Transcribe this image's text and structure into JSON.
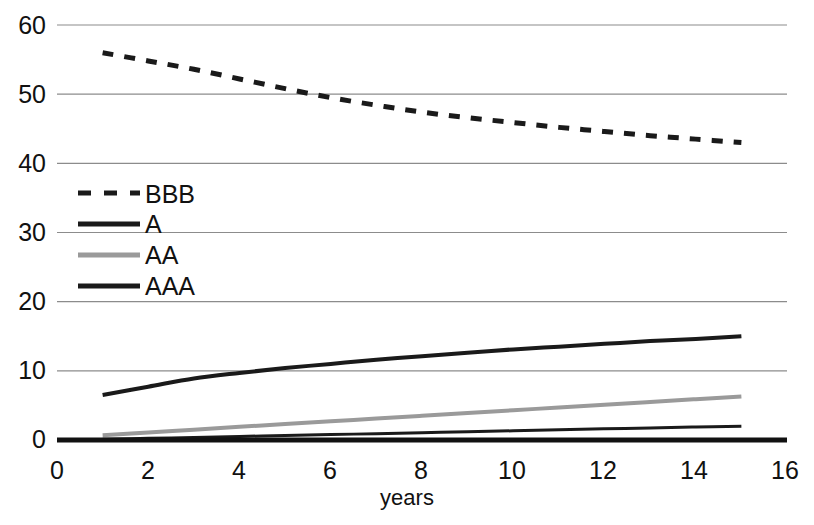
{
  "chart_data": {
    "type": "line",
    "title": "",
    "subtitle": "",
    "xlabel": "years",
    "ylabel": "",
    "xlim": [
      0,
      16
    ],
    "ylim": [
      0,
      60
    ],
    "grid": true,
    "grid_axis": "y",
    "legend_position": "upper-left-inside",
    "x_ticks": [
      0,
      2,
      4,
      6,
      8,
      10,
      12,
      14,
      16
    ],
    "x_tick_labels": [
      "0",
      "2",
      "4",
      "6",
      "8",
      "10",
      "12",
      "14",
      "16"
    ],
    "y_ticks": [
      0,
      10,
      20,
      30,
      40,
      50,
      60
    ],
    "y_tick_labels": [
      "0",
      "10",
      "20",
      "30",
      "40",
      "50",
      "60"
    ],
    "x": [
      1,
      2,
      3,
      4,
      5,
      6,
      7,
      8,
      9,
      10,
      11,
      12,
      13,
      14,
      15
    ],
    "series": [
      {
        "name": "BBB",
        "style": "dashed",
        "color": "#1a1a1a",
        "width": 5,
        "values": [
          56.0,
          54.8,
          53.6,
          52.2,
          50.8,
          49.5,
          48.4,
          47.4,
          46.6,
          45.9,
          45.2,
          44.6,
          44.0,
          43.5,
          43.0
        ]
      },
      {
        "name": "A",
        "style": "solid",
        "color": "#1a1a1a",
        "width": 4,
        "values": [
          6.5,
          7.7,
          8.9,
          9.7,
          10.4,
          11.0,
          11.6,
          12.1,
          12.6,
          13.1,
          13.5,
          13.9,
          14.3,
          14.6,
          15.0
        ]
      },
      {
        "name": "AA",
        "style": "solid",
        "color": "#9a9a9a",
        "width": 4,
        "values": [
          0.7,
          1.1,
          1.5,
          1.9,
          2.3,
          2.7,
          3.1,
          3.5,
          3.9,
          4.3,
          4.7,
          5.1,
          5.5,
          5.9,
          6.3
        ]
      },
      {
        "name": "AAA",
        "style": "solid",
        "color": "#1a1a1a",
        "width": 3,
        "values": [
          0.1,
          0.24,
          0.37,
          0.51,
          0.65,
          0.78,
          0.92,
          1.06,
          1.2,
          1.33,
          1.47,
          1.61,
          1.74,
          1.88,
          2.0
        ]
      }
    ],
    "legend_entries": [
      {
        "label": "BBB",
        "style": "dashed",
        "color": "#1a1a1a",
        "width": 5
      },
      {
        "label": "A",
        "style": "solid",
        "color": "#1a1a1a",
        "width": 5
      },
      {
        "label": "AA",
        "style": "solid",
        "color": "#9a9a9a",
        "width": 5
      },
      {
        "label": "AAA",
        "style": "solid",
        "color": "#1a1a1a",
        "width": 5
      }
    ]
  },
  "axes": {
    "x_title": "years"
  },
  "ticks": {
    "y": [
      "60",
      "50",
      "40",
      "30",
      "20",
      "10",
      "0"
    ],
    "x": [
      "0",
      "2",
      "4",
      "6",
      "8",
      "10",
      "12",
      "14",
      "16"
    ]
  },
  "legend": {
    "items": [
      {
        "label": "BBB"
      },
      {
        "label": "A"
      },
      {
        "label": "AA"
      },
      {
        "label": "AAA"
      }
    ]
  },
  "colors": {
    "gridline": "#8c8c8c",
    "axis": "#111111",
    "series_dark": "#1a1a1a",
    "series_gray": "#9a9a9a",
    "background": "#ffffff"
  }
}
